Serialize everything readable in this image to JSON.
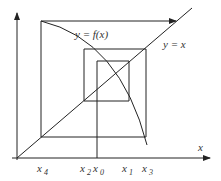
{
  "diagram": {
    "labels": {
      "curve": "y = f(x)",
      "diagonal": "y = x",
      "x_axis": "x",
      "ticks": [
        {
          "base": "x",
          "sub": "4"
        },
        {
          "base": "x",
          "sub": "2"
        },
        {
          "base": "x",
          "sub": "0"
        },
        {
          "base": "x",
          "sub": "1"
        },
        {
          "base": "x",
          "sub": "3"
        }
      ]
    },
    "colors": {
      "line": "#222222",
      "text": "#333333",
      "background": "#ffffff"
    }
  }
}
